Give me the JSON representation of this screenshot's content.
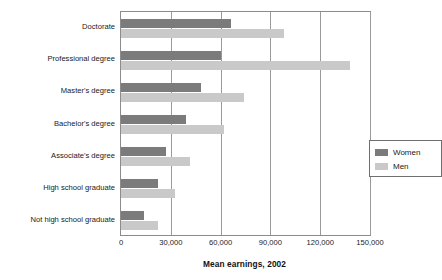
{
  "chart_data": {
    "type": "bar",
    "orientation": "horizontal",
    "title": "",
    "xlabel": "Mean earnings, 2002",
    "ylabel": "",
    "xlim": [
      0,
      150000
    ],
    "grid": true,
    "legend_position": "center-right",
    "xticks": [
      0,
      30000,
      60000,
      90000,
      120000,
      150000
    ],
    "xticklabels": [
      "0",
      "30,000",
      "60,000",
      "90,000",
      "120,000",
      "150,000"
    ],
    "categories": [
      "Doctorate",
      "Professional degree",
      "Master's degree",
      "Bachelor's degree",
      "Associate's degree",
      "High school graduate",
      "Not high school graduate"
    ],
    "series": [
      {
        "name": "Women",
        "color": "#7b7b7b",
        "values": [
          66000,
          60000,
          48000,
          39000,
          27000,
          22000,
          14000
        ]
      },
      {
        "name": "Men",
        "color": "#c9c9c9",
        "values": [
          98000,
          138000,
          74000,
          62000,
          41500,
          32500,
          22000
        ]
      }
    ]
  },
  "legend": {
    "items": [
      {
        "label": "Women",
        "color": "#7b7b7b"
      },
      {
        "label": "Men",
        "color": "#c9c9c9"
      }
    ]
  },
  "axis": {
    "title": "Mean earnings, 2002"
  },
  "style": {
    "plot_border_color": "#8c8c8c",
    "gridline_color": "#9a9a9a",
    "background": "#ffffff",
    "text_color": "#1a1a1a"
  }
}
